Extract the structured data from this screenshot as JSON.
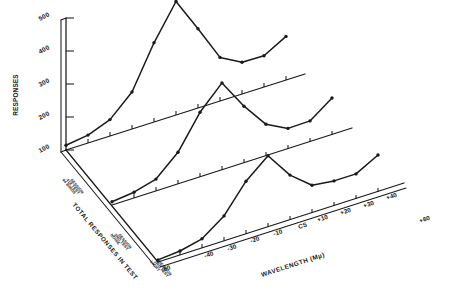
{
  "figure": {
    "name": "wavelength-generalization-gradients",
    "background": "#ffffff",
    "ink_color": "#1a1a1a"
  },
  "axes": {
    "y_title": "RESPONSES",
    "y_ticks": [
      "100",
      "200",
      "300",
      "400",
      "500"
    ],
    "y_values": [
      100,
      200,
      300,
      400,
      500
    ],
    "x_title": "WAVELENGTH (Mµ)",
    "x_ticks": [
      "-60",
      "-40",
      "-30",
      "-20",
      "-10",
      "CS",
      "+10",
      "+20",
      "+30",
      "+40",
      "+60"
    ],
    "depth_title": "TOTAL RESPONSES IN TEST"
  },
  "row_labels": {
    "back": "94 BIRDS\n418 TEST\nSESSION",
    "middle": "NOISE\n2ND TEST\nSESSION",
    "front": "LIGHT\n3RD TEST\nSESSION"
  },
  "chart_data": {
    "type": "line",
    "xlabel": "WAVELENGTH (Mµ)",
    "ylabel": "RESPONSES",
    "ylim": [
      0,
      500
    ],
    "grid": false,
    "legend": "none",
    "projection": "pseudo-3d-stacked",
    "categories": [
      "-60",
      "-40",
      "-30",
      "-20",
      "-10",
      "CS",
      "+10",
      "+20",
      "+30",
      "+40",
      "+60"
    ],
    "x": [
      -60,
      -40,
      -30,
      -20,
      -10,
      0,
      10,
      20,
      30,
      40,
      60
    ],
    "series": [
      {
        "name": "back",
        "label": "94 BIRDS 418 TEST SESSION",
        "values": [
          18,
          30,
          62,
          140,
          300,
          430,
          300,
          165,
          120,
          118,
          165
        ]
      },
      {
        "name": "middle",
        "label": "NOISE 2ND TEST SESSION",
        "values": [
          12,
          22,
          45,
          120,
          245,
          330,
          215,
          120,
          78,
          80,
          140
        ]
      },
      {
        "name": "front",
        "label": "LIGHT 3RD TEST SESSION",
        "values": [
          8,
          15,
          35,
          95,
          200,
          270,
          170,
          105,
          95,
          95,
          140
        ]
      }
    ]
  }
}
